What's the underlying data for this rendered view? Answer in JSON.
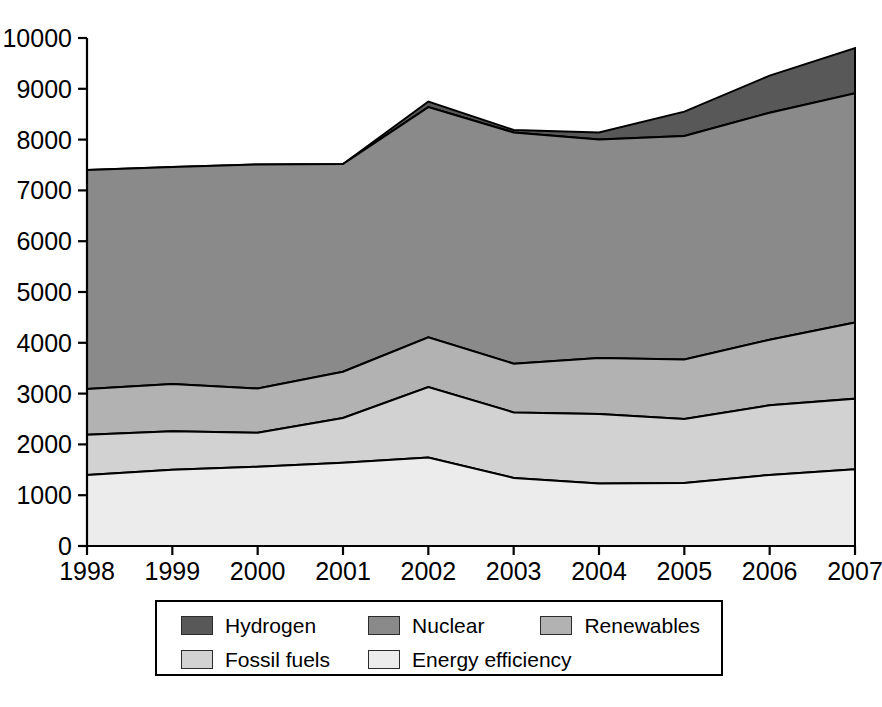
{
  "chart_data": {
    "type": "area",
    "stacked": true,
    "title": "",
    "xlabel": "",
    "ylabel": "",
    "categories": [
      "1998",
      "1999",
      "2000",
      "2001",
      "2002",
      "2003",
      "2004",
      "2005",
      "2006",
      "2007"
    ],
    "x": [
      1998,
      1999,
      2000,
      2001,
      2002,
      2003,
      2004,
      2005,
      2006,
      2007
    ],
    "xlim": [
      1998,
      2007
    ],
    "ylim": [
      0,
      10000
    ],
    "yticks": [
      0,
      1000,
      2000,
      3000,
      4000,
      5000,
      6000,
      7000,
      8000,
      9000,
      10000
    ],
    "ytick_labels": [
      "0",
      "1000",
      "2000",
      "3000",
      "4000",
      "5000",
      "6000",
      "7000",
      "8000",
      "9000",
      "10000"
    ],
    "grid": false,
    "legend_position": "bottom",
    "series": [
      {
        "name": "Energy efficiency",
        "color": "#ececec",
        "values": [
          1400,
          1500,
          1560,
          1640,
          1740,
          1340,
          1230,
          1240,
          1400,
          1510
        ]
      },
      {
        "name": "Fossil fuels",
        "color": "#d2d2d2",
        "values": [
          790,
          760,
          670,
          880,
          1390,
          1290,
          1370,
          1260,
          1370,
          1390
        ]
      },
      {
        "name": "Renewables",
        "color": "#b2b2b2",
        "values": [
          900,
          930,
          870,
          910,
          980,
          960,
          1100,
          1170,
          1290,
          1500
        ]
      },
      {
        "name": "Nuclear",
        "color": "#8a8a8a",
        "values": [
          4310,
          4270,
          4410,
          4090,
          4530,
          4550,
          4300,
          4400,
          4470,
          4510
        ]
      },
      {
        "name": "Hydrogen",
        "color": "#585858",
        "values": [
          0,
          0,
          0,
          0,
          110,
          50,
          140,
          480,
          730,
          890
        ]
      }
    ],
    "stack_tops": {
      "energy_efficiency": [
        1400,
        1500,
        1560,
        1640,
        1740,
        1340,
        1230,
        1240,
        1400,
        1510
      ],
      "fossil_fuels": [
        2190,
        2260,
        2230,
        2520,
        3130,
        2630,
        2600,
        2500,
        2770,
        2900
      ],
      "renewables": [
        3090,
        3190,
        3100,
        3430,
        4110,
        3590,
        3700,
        3670,
        4060,
        4400
      ],
      "nuclear": [
        7400,
        7460,
        7510,
        7520,
        8640,
        8140,
        8000,
        8070,
        8530,
        8910
      ],
      "hydrogen": [
        7400,
        7460,
        7510,
        7520,
        8750,
        8190,
        8140,
        8550,
        9260,
        9800
      ]
    }
  },
  "legend": {
    "items": [
      {
        "label": "Hydrogen",
        "color": "#585858"
      },
      {
        "label": "Nuclear",
        "color": "#8a8a8a"
      },
      {
        "label": "Renewables",
        "color": "#b2b2b2"
      },
      {
        "label": "Fossil fuels",
        "color": "#d2d2d2"
      },
      {
        "label": "Energy efficiency",
        "color": "#ececec"
      }
    ]
  }
}
